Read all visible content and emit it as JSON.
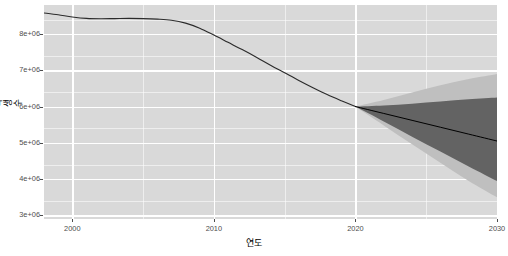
{
  "chart_data": {
    "type": "line",
    "title": "",
    "xlabel": "연도",
    "ylabel": "학생수",
    "xlim": [
      1998,
      2030
    ],
    "ylim": [
      2900000,
      8800000
    ],
    "xticks": [
      2000,
      2010,
      2020,
      2030
    ],
    "xticklabels": [
      "2000",
      "2010",
      "2020",
      "2030"
    ],
    "yticks": [
      3000000,
      4000000,
      5000000,
      6000000,
      7000000,
      8000000
    ],
    "yticklabels": [
      "3e+06",
      "4e+06",
      "5e+06",
      "6e+06",
      "7e+06",
      "8e+06"
    ],
    "grid": true,
    "legend": "none",
    "panel_bg": "#D9D9D9",
    "grid_color": "#FFFFFF",
    "line_color": "#000000",
    "band_outer_color": "#BFBFBF",
    "band_inner_color": "#636363",
    "series": [
      {
        "name": "historical",
        "x": [
          1998,
          1999,
          2000,
          2001,
          2002,
          2003,
          2004,
          2005,
          2006,
          2007,
          2008,
          2009,
          2010,
          2011,
          2012,
          2013,
          2014,
          2015,
          2016,
          2017,
          2018,
          2019,
          2020
        ],
        "values": [
          8580000,
          8530000,
          8470000,
          8430000,
          8420000,
          8425000,
          8430000,
          8425000,
          8410000,
          8380000,
          8300000,
          8160000,
          7970000,
          7770000,
          7570000,
          7360000,
          7140000,
          6930000,
          6720000,
          6520000,
          6330000,
          6160000,
          6000000
        ]
      },
      {
        "name": "projection-median",
        "x": [
          2020,
          2022,
          2024,
          2026,
          2028,
          2030
        ],
        "values": [
          6000000,
          5810000,
          5620000,
          5430000,
          5240000,
          5050000
        ]
      },
      {
        "name": "projection-ci-inner-high",
        "x": [
          2020,
          2022,
          2024,
          2026,
          2028,
          2030
        ],
        "values": [
          6000000,
          6030000,
          6080000,
          6140000,
          6200000,
          6250000
        ]
      },
      {
        "name": "projection-ci-inner-low",
        "x": [
          2020,
          2022,
          2024,
          2026,
          2028,
          2030
        ],
        "values": [
          6000000,
          5590000,
          5170000,
          4760000,
          4350000,
          3950000
        ]
      },
      {
        "name": "projection-ci-outer-high",
        "x": [
          2020,
          2022,
          2024,
          2026,
          2028,
          2030
        ],
        "values": [
          6000000,
          6180000,
          6390000,
          6590000,
          6760000,
          6900000
        ]
      },
      {
        "name": "projection-ci-outer-low",
        "x": [
          2020,
          2022,
          2024,
          2026,
          2028,
          2030
        ],
        "values": [
          6000000,
          5480000,
          4960000,
          4450000,
          3950000,
          3500000
        ]
      }
    ]
  }
}
